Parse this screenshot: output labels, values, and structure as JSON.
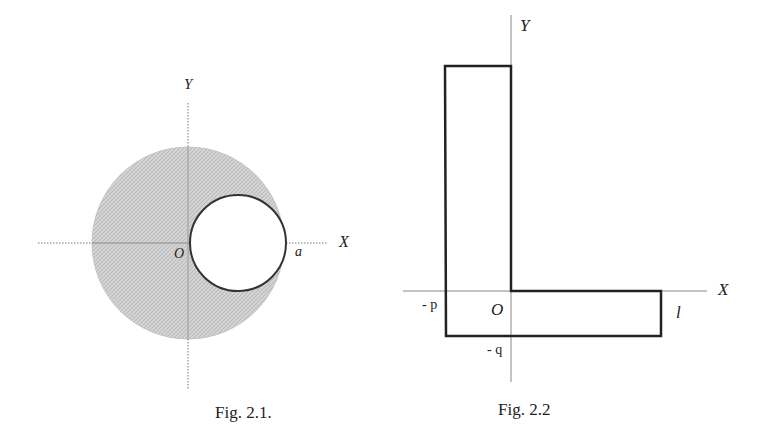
{
  "figures": [
    {
      "id": "fig-2-1",
      "caption": "Fig. 2.1.",
      "axis_labels": {
        "x": "X",
        "y": "Y",
        "origin": "O"
      },
      "annotations": {
        "radius_point": "a"
      },
      "shapes": {
        "outer_circle": {
          "cx": 188,
          "cy": 243,
          "r": 96,
          "fill": "#cfcfcf"
        },
        "inner_circle": {
          "cx": 238,
          "cy": 243,
          "r": 48,
          "fill": "#ffffff",
          "stroke": "#333333"
        }
      }
    },
    {
      "id": "fig-2-2",
      "caption": "Fig. 2.2",
      "axis_labels": {
        "x": "X",
        "y": "Y",
        "origin": "O"
      },
      "annotations": {
        "left_coord": "- p",
        "bottom_coord": "- q",
        "length": "l"
      },
      "shapes": {
        "l_outline_points": "445,66 511,66 511,291 661,291 661,336 446,336"
      }
    }
  ],
  "colors": {
    "line": "#2a2a2a",
    "axis": "#666666",
    "shade": "#cfcfcf"
  }
}
